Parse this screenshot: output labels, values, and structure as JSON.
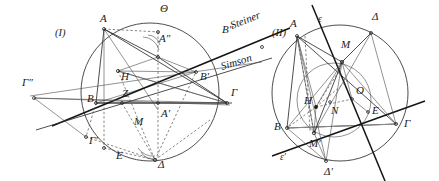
{
  "figure": {
    "title_visible": false,
    "width": 439,
    "height": 181,
    "background": "#ffffff",
    "ink_color": "#1a1a1a"
  },
  "panel_one": {
    "caption": "(I)",
    "named_lines": {
      "steiner": "Steiner",
      "simson": "Simson"
    },
    "points": [
      {
        "id": "A",
        "label": "A",
        "x": 100,
        "y": 22
      },
      {
        "id": "Th",
        "label": "Θ",
        "x": 160,
        "y": 12
      },
      {
        "id": "A2",
        "label": "A″",
        "x": 159,
        "y": 42
      },
      {
        "id": "B2",
        "label": "B″",
        "x": 222,
        "y": 33
      },
      {
        "id": "H",
        "label": "H",
        "x": 121,
        "y": 80
      },
      {
        "id": "Z",
        "label": "Z",
        "x": 122,
        "y": 97
      },
      {
        "id": "B",
        "label": "B",
        "x": 87,
        "y": 102
      },
      {
        "id": "Bp",
        "label": "B′",
        "x": 200,
        "y": 80
      },
      {
        "id": "G",
        "label": "Γ",
        "x": 231,
        "y": 96
      },
      {
        "id": "Ap",
        "label": "A′",
        "x": 161,
        "y": 117
      },
      {
        "id": "M",
        "label": "M",
        "x": 134,
        "y": 125
      },
      {
        "id": "E",
        "label": "E",
        "x": 116,
        "y": 159
      },
      {
        "id": "D",
        "label": "Δ",
        "x": 158,
        "y": 168
      },
      {
        "id": "G1",
        "label": "Γ′",
        "x": 89,
        "y": 144
      },
      {
        "id": "G2",
        "label": "Γ″",
        "x": 22,
        "y": 86
      }
    ]
  },
  "panel_two": {
    "caption": "(II)",
    "points": [
      {
        "id": "A",
        "label": "A",
        "x": 294,
        "y": 27
      },
      {
        "id": "eps",
        "label": "ε",
        "x": 330,
        "y": 22
      },
      {
        "id": "D",
        "label": "Δ",
        "x": 375,
        "y": 20
      },
      {
        "id": "M",
        "label": "M",
        "x": 342,
        "y": 48
      },
      {
        "id": "O",
        "label": "O",
        "x": 356,
        "y": 94
      },
      {
        "id": "H",
        "label": "H",
        "x": 310,
        "y": 100
      },
      {
        "id": "N",
        "label": "N",
        "x": 333,
        "y": 109
      },
      {
        "id": "E",
        "label": "E",
        "x": 372,
        "y": 114
      },
      {
        "id": "B",
        "label": "B",
        "x": 279,
        "y": 127
      },
      {
        "id": "G",
        "label": "Γ",
        "x": 404,
        "y": 127
      },
      {
        "id": "Mp",
        "label": "M′",
        "x": 313,
        "y": 141
      },
      {
        "id": "epsp",
        "label": "ε′",
        "x": 286,
        "y": 157
      },
      {
        "id": "Dp",
        "label": "Δ′",
        "x": 330,
        "y": 171
      }
    ]
  }
}
